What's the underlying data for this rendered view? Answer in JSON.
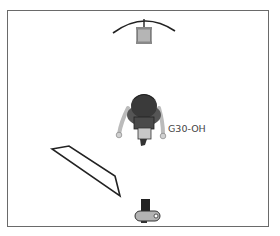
{
  "diagram": {
    "type": "lighting-setup-overhead",
    "elements": [
      {
        "id": "light-top",
        "kind": "strobe-with-reflector",
        "position": "top-center"
      },
      {
        "id": "subject",
        "kind": "model-overhead-view",
        "position": "center"
      },
      {
        "id": "reflector-panel",
        "kind": "reflector-card",
        "position": "lower-left"
      },
      {
        "id": "camera",
        "kind": "camera",
        "position": "bottom-center"
      }
    ],
    "labels": {
      "subject_label": "G30-OH"
    },
    "colors": {
      "border": "#6a6a6a",
      "outline": "#222222",
      "light_body": "#b8b8b8",
      "hair": "#3a3a3a",
      "skin": "#cfcfcf"
    }
  }
}
